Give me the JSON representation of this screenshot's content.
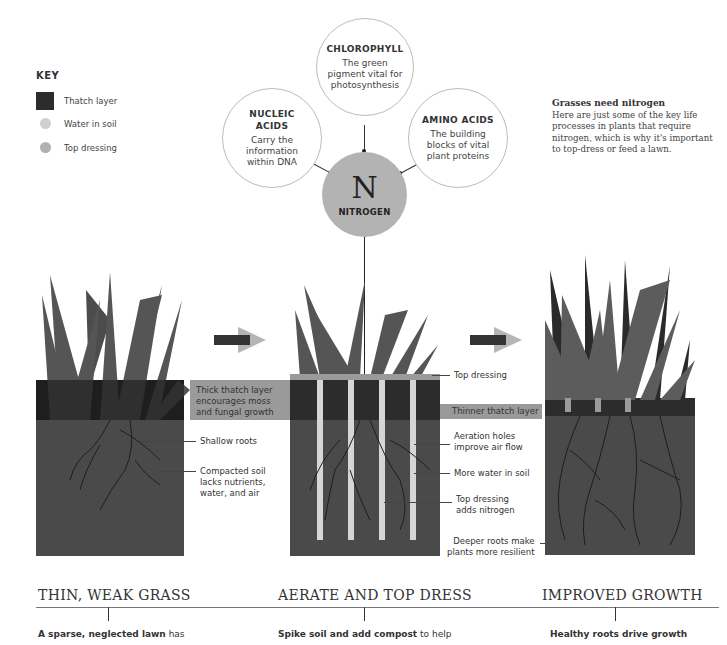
{
  "key": {
    "title": "KEY",
    "items": [
      {
        "label": "Thatch layer",
        "color": "#2c2c2c",
        "shape": "square"
      },
      {
        "label": "Water in soil",
        "color": "#cfcfcf",
        "shape": "dot"
      },
      {
        "label": "Top dressing",
        "color": "#b0b0b0",
        "shape": "dot"
      }
    ]
  },
  "nitrogen_diagram": {
    "center": {
      "symbol": "N",
      "label": "NITROGEN",
      "color": "#b3b3b3"
    },
    "processes": [
      {
        "title_line1": "NUCLEIC",
        "title_line2": "ACIDS",
        "desc_line1": "Carry the",
        "desc_line2": "information",
        "desc_line3": "within DNA"
      },
      {
        "title_line1": "CHLOROPHYLL",
        "desc_line1": "The green",
        "desc_line2": "pigment vital for",
        "desc_line3": "photosynthesis"
      },
      {
        "title_line1": "AMINO ACIDS",
        "desc_line1": "The building",
        "desc_line2": "blocks of vital",
        "desc_line3": "plant proteins"
      }
    ]
  },
  "sidebar_note": {
    "title": "Grasses need nitrogen",
    "body": "Here are just some of the key life processes in plants that require nitrogen, which is why it's important to top-dress or feed a lawn."
  },
  "panels": {
    "left": {
      "band_label": [
        "Thick thatch layer",
        "encourages moss",
        "and fungal growth"
      ],
      "annotations": [
        {
          "lines": [
            "Shallow roots"
          ]
        },
        {
          "lines": [
            "Compacted soil",
            "lacks nutrients,",
            "water, and air"
          ]
        }
      ]
    },
    "middle": {
      "annotations": [
        {
          "lines": [
            "Top dressing"
          ]
        },
        {
          "lines": [
            "Aeration holes",
            "improve air flow"
          ]
        },
        {
          "lines": [
            "More water in soil"
          ]
        },
        {
          "lines": [
            "Top dressing",
            "adds nitrogen"
          ]
        },
        {
          "lines": [
            "Deeper roots make",
            "plants more resilient"
          ]
        }
      ],
      "band_label": "Thinner thatch layer"
    }
  },
  "colors": {
    "soil": "#4a4a4a",
    "thatch": "#2c2c2c",
    "grass": "#555555",
    "band": "#9a9a9a",
    "arrow_dark": "#333333",
    "arrow_light": "#b5b5b5"
  },
  "stages": [
    {
      "title": "THIN, WEAK GRASS",
      "caption_bold": "A sparse, neglected lawn",
      "caption_rest": " has"
    },
    {
      "title": "AERATE AND TOP DRESS",
      "caption_bold": "Spike soil and add compost",
      "caption_rest": " to help"
    },
    {
      "title": "IMPROVED GROWTH",
      "caption_bold": "Healthy roots drive growth",
      "caption_rest": ""
    }
  ]
}
